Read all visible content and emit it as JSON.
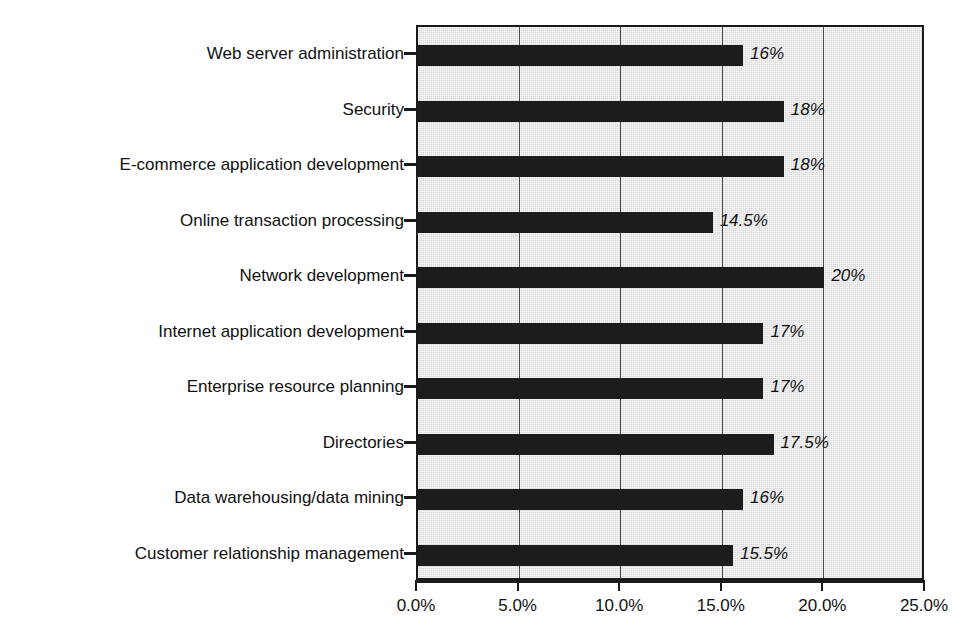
{
  "chart_data": {
    "type": "bar",
    "orientation": "horizontal",
    "title": "",
    "subtitle": "",
    "xlabel": "",
    "ylabel": "",
    "xlim": [
      0,
      25
    ],
    "ylim": null,
    "grid": true,
    "legend": null,
    "legend_position": "none",
    "categories": [
      "Web server administration",
      "Security",
      "E-commerce application development",
      "Online transaction processing",
      "Network development",
      "Internet application development",
      "Enterprise resource planning",
      "Directories",
      "Data warehousing/data mining",
      "Customer relationship management"
    ],
    "values": [
      16,
      18,
      18,
      14.5,
      20,
      17,
      17,
      17.5,
      16,
      15.5
    ],
    "value_labels": [
      "16%",
      "18%",
      "18%",
      "14.5%",
      "20%",
      "17%",
      "17%",
      "17.5%",
      "16%",
      "15.5%"
    ],
    "xticks": [
      0,
      5,
      10,
      15,
      20,
      25
    ],
    "xtick_labels": [
      "0.0%",
      "5.0%",
      "10.0%",
      "15.0%",
      "20.0%",
      "25.0%"
    ],
    "bar_color": "#1c1c1c",
    "plot_background_color": "#d9d9d9",
    "axis_color": "#1a1a1a",
    "text_color": "#111111"
  },
  "caption": {
    "text": ""
  }
}
